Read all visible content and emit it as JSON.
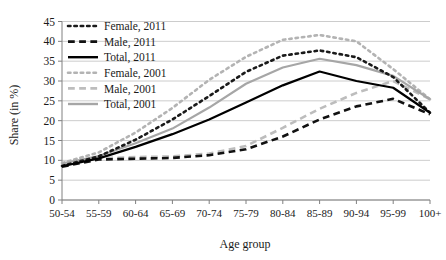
{
  "chart_data": {
    "type": "line",
    "title": "",
    "xlabel": "Age group",
    "ylabel": "Share (in %)",
    "categories": [
      "50-54",
      "55-59",
      "60-64",
      "65-69",
      "70-74",
      "75-79",
      "80-84",
      "85-89",
      "90-94",
      "95-99",
      "100+"
    ],
    "ylim": [
      0,
      45
    ],
    "ytick_step": 5,
    "yticks": [
      "0",
      "5",
      "10",
      "15",
      "20",
      "25",
      "30",
      "35",
      "40",
      "45"
    ],
    "grid": true,
    "legend_position": "top-left",
    "series": [
      {
        "name": "Female, 2011",
        "style": "dotted",
        "color": "#1a1a1a",
        "values": [
          8.6,
          11.0,
          15.2,
          20.3,
          26.2,
          32.3,
          36.4,
          37.7,
          36.0,
          31.0,
          22.0
        ]
      },
      {
        "name": "Male, 2011",
        "style": "dashed",
        "color": "#111111",
        "values": [
          8.4,
          10.2,
          10.4,
          10.6,
          11.3,
          12.8,
          16.0,
          20.3,
          23.6,
          25.5,
          21.6
        ]
      },
      {
        "name": "Total, 2011",
        "style": "solid",
        "color": "#000000",
        "values": [
          8.5,
          10.5,
          13.4,
          16.6,
          20.3,
          24.6,
          28.9,
          32.4,
          30.0,
          28.3,
          22.0
        ]
      },
      {
        "name": "Female, 2001",
        "style": "dotted",
        "color": "#b3b3b3",
        "values": [
          9.3,
          12.0,
          17.0,
          23.2,
          30.3,
          36.1,
          40.4,
          41.6,
          40.0,
          33.0,
          25.4
        ]
      },
      {
        "name": "Male, 2001",
        "style": "dashed",
        "color": "#bdbdbd",
        "values": [
          9.1,
          10.5,
          10.8,
          11.0,
          11.7,
          13.6,
          18.2,
          23.0,
          27.0,
          30.0,
          25.4
        ]
      },
      {
        "name": "Total, 2001",
        "style": "solid",
        "color": "#a6a6a6",
        "values": [
          9.2,
          11.1,
          14.3,
          18.0,
          23.3,
          29.3,
          33.4,
          35.6,
          34.0,
          31.3,
          25.4
        ]
      }
    ]
  },
  "legend": {
    "items": [
      {
        "label": "Female, 2011"
      },
      {
        "label": "Male, 2011"
      },
      {
        "label": "Total, 2011"
      },
      {
        "label": "Female, 2001"
      },
      {
        "label": "Male, 2001"
      },
      {
        "label": "Total, 2001"
      }
    ]
  },
  "colors": {
    "grid": "#bfbfbf",
    "axis": "#808080",
    "text": "#1a1a1a",
    "black_series": "#000000",
    "gray_series": "#a6a6a6"
  }
}
